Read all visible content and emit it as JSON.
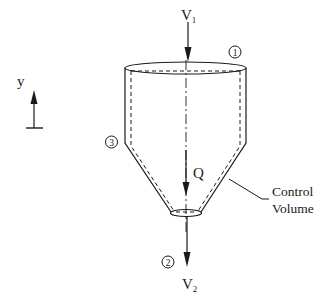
{
  "diagram": {
    "labels": {
      "inlet_velocity": "V",
      "inlet_velocity_sub": "1",
      "outlet_velocity": "V",
      "outlet_velocity_sub": "2",
      "heat": "Q",
      "axis": "y",
      "cv_line1": "Control",
      "cv_line2": "Volume",
      "station1": "1",
      "station2": "2",
      "station3": "3"
    },
    "colors": {
      "stroke": "#1a1a1a",
      "background": "#ffffff"
    }
  }
}
